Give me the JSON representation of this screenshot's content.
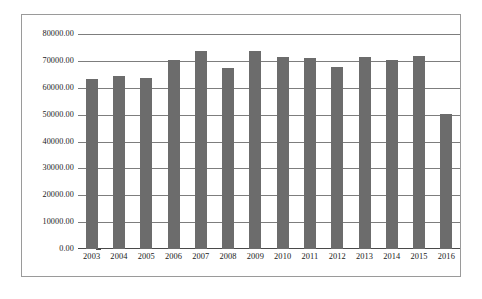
{
  "chart_data": {
    "type": "bar",
    "title": "",
    "subtitle": "",
    "xlabel": "",
    "ylabel": "",
    "categories": [
      "2003",
      "2004",
      "2005",
      "2006",
      "2007",
      "2008",
      "2009",
      "2010",
      "2011",
      "2012",
      "2013",
      "2014",
      "2015",
      "2016"
    ],
    "values": [
      63400,
      64200,
      63600,
      70400,
      73700,
      67400,
      73800,
      71400,
      71200,
      67700,
      71600,
      70300,
      72000,
      50300
    ],
    "series": [
      {
        "name": "",
        "values": [
          63400,
          64200,
          63600,
          70400,
          73700,
          67400,
          73800,
          71400,
          71200,
          67700,
          71600,
          70300,
          72000,
          50300
        ]
      }
    ],
    "ylim": [
      0,
      80000
    ],
    "ytick_values": [
      80000,
      70000,
      60000,
      50000,
      40000,
      30000,
      20000,
      10000,
      0
    ],
    "ytick_labels": [
      "80000.00",
      "70000.00",
      "60000.00",
      "50000.00",
      "40000.00",
      "30000.00",
      "20000.00",
      "10000.00",
      "0.00"
    ],
    "grid": true,
    "grid_axis": "y",
    "legend": false,
    "legend_position": "none",
    "bar_color": "#6c6c6c",
    "gridline_color": "#7d7d7d",
    "axis_color": "#4a4a4a",
    "frame_color": "#9a9a9a",
    "background_color": "#ffffff",
    "annotations": []
  }
}
